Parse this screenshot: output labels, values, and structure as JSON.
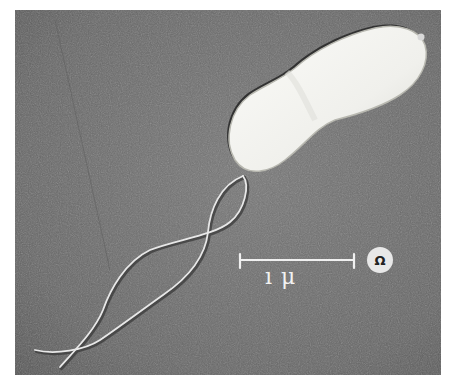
{
  "figure": {
    "scale_bar": {
      "label": "1μ",
      "display_label": "ı μ"
    },
    "badge": {
      "icon": "omega-icon",
      "glyph": "Ω"
    },
    "colors": {
      "background": "#6b6b6b",
      "cell_body": "#f4f4f0",
      "cell_outline": "#2a2a2a",
      "flagella": "#e6e6e6",
      "scale_bar": "#f0f0f0",
      "border": "#ffffff"
    }
  }
}
